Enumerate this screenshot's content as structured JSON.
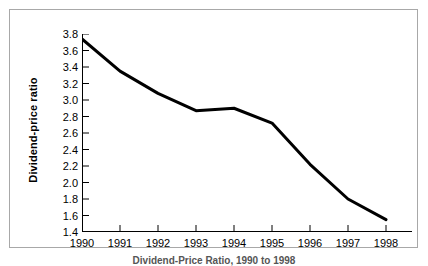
{
  "chart_data": {
    "type": "line",
    "title": "",
    "subtitle": "",
    "xlabel": "",
    "ylabel": "Dividend-price ratio",
    "categories": [
      "1990",
      "1991",
      "1992",
      "1993",
      "1994",
      "1995",
      "1996",
      "1997",
      "1998"
    ],
    "x": [
      1990,
      1991,
      1992,
      1993,
      1994,
      1995,
      1996,
      1997,
      1998
    ],
    "values": [
      3.74,
      3.35,
      3.08,
      2.87,
      2.9,
      2.72,
      2.22,
      1.8,
      1.55
    ],
    "series": [
      {
        "name": "Dividend-price ratio",
        "values": [
          3.74,
          3.35,
          3.08,
          2.87,
          2.9,
          2.72,
          2.22,
          1.8,
          1.55
        ],
        "color": "#000000"
      }
    ],
    "xlim": [
      1990,
      1998
    ],
    "ylim": [
      1.4,
      3.8
    ],
    "ytick_labels": [
      "3.8",
      "3.6",
      "3.4",
      "3.2",
      "3.0",
      "2.8",
      "2.6",
      "2.4",
      "2.2",
      "2.0",
      "1.8",
      "1.6",
      "1.4"
    ],
    "ytick_values": [
      3.8,
      3.6,
      3.4,
      3.2,
      3.0,
      2.8,
      2.6,
      2.4,
      2.2,
      2.0,
      1.8,
      1.6,
      1.4
    ],
    "ytick_step": 0.2,
    "grid": false,
    "legend": false,
    "legend_position": "none",
    "line_width": 3,
    "axis_color": "#000000",
    "background": "#ffffff"
  },
  "figure": {
    "caption": "Dividend-Price Ratio, 1990 to 1998",
    "border_color": "#a8a8a8"
  }
}
